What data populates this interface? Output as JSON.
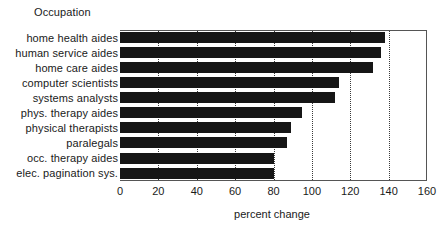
{
  "chart_data": {
    "type": "bar",
    "orientation": "horizontal",
    "title": "",
    "xlabel": "percent change",
    "ylabel": "Occupation",
    "categories": [
      "home health aides",
      "human service aides",
      "home care aides",
      "computer scientists",
      "systems analysts",
      "phys. therapy aides",
      "physical therapists",
      "paralegals",
      "occ. therapy aides",
      "elec. pagination sys."
    ],
    "values": [
      138,
      136,
      132,
      114,
      112,
      95,
      89,
      87,
      80,
      80
    ],
    "xlim": [
      0,
      160
    ],
    "xticks": [
      0,
      20,
      40,
      60,
      80,
      100,
      120,
      140,
      160
    ],
    "xtick_labels": [
      "0",
      "20",
      "40",
      "60",
      "80",
      "100",
      "120",
      "140",
      "160"
    ],
    "gridlines": [
      20,
      40,
      60,
      80,
      100,
      120,
      140
    ],
    "grid": "vertical-dotted",
    "legend": "none",
    "bar_color": "#161616",
    "frame_color": "#555555"
  }
}
